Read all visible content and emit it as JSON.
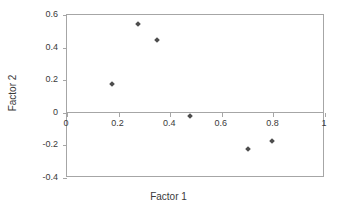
{
  "chart_data": {
    "type": "scatter",
    "title": "",
    "xlabel": "Factor 1",
    "ylabel": "Factor 2",
    "xlim": [
      0,
      1
    ],
    "ylim": [
      -0.4,
      0.6
    ],
    "grid": false,
    "legend": null,
    "zero_line": 0,
    "marker_color": "#4d4d4d",
    "frame_color": "#a6a6a6",
    "xticks": [
      "0",
      "0.2",
      "0.4",
      "0.6",
      "0.8",
      "1"
    ],
    "xtick_values": [
      0,
      0.2,
      0.4,
      0.6,
      0.8,
      1
    ],
    "yticks": [
      "0.6",
      "0.4",
      "0.2",
      "0",
      "-0.2",
      "-0.4"
    ],
    "ytick_values": [
      0.6,
      0.4,
      0.2,
      0,
      -0.2,
      -0.4
    ],
    "points": [
      {
        "x": 0.175,
        "y": 0.175
      },
      {
        "x": 0.275,
        "y": 0.545
      },
      {
        "x": 0.35,
        "y": 0.445
      },
      {
        "x": 0.475,
        "y": -0.02
      },
      {
        "x": 0.7,
        "y": -0.225
      },
      {
        "x": 0.795,
        "y": -0.175
      }
    ]
  }
}
